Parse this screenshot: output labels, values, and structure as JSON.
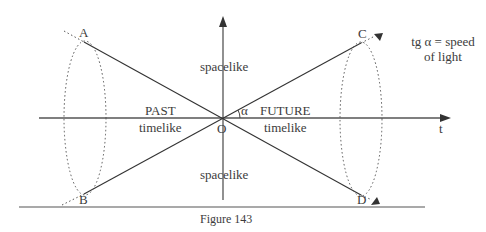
{
  "figure": {
    "caption": "Figure 143",
    "points": {
      "A": "A",
      "B": "B",
      "C": "C",
      "D": "D",
      "O": "O"
    },
    "axis_label_t": "t",
    "angle_symbol": "α",
    "regions": {
      "spacelike_top": "spacelike",
      "spacelike_bottom": "spacelike",
      "past_title": "PAST",
      "past_sub": "timelike",
      "future_title": "FUTURE",
      "future_sub": "timelike"
    },
    "note_line1": "tg α = speed",
    "note_line2": "of light"
  }
}
